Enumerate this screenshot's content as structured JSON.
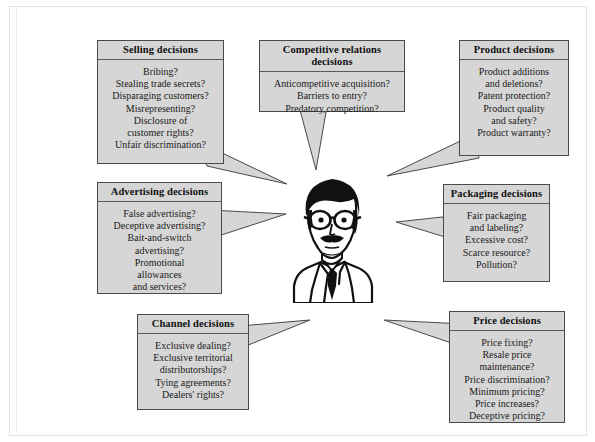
{
  "diagram": {
    "center_figure": "businessman-with-glasses-and-mustache"
  },
  "bubbles": [
    {
      "id": "selling",
      "title": "Selling decisions",
      "lines": [
        "Bribing?",
        "Stealing trade secrets?",
        "Disparaging customers?",
        "Misrepresenting?",
        "Disclosure of",
        "customer rights?",
        "Unfair discrimination?"
      ]
    },
    {
      "id": "competitive-relations",
      "title": "Competitive relations decisions",
      "lines": [
        "Anticompetitive acquisition?",
        "Barriers to entry?",
        "Predatory competition?"
      ]
    },
    {
      "id": "product",
      "title": "Product decisions",
      "lines": [
        "Product additions",
        "and deletions?",
        "Patent protection?",
        "Product quality",
        "and safety?",
        "Product warranty?"
      ]
    },
    {
      "id": "advertising",
      "title": "Advertising decisions",
      "lines": [
        "False advertising?",
        "Deceptive advertising?",
        "Bait-and-switch",
        "advertising?",
        "Promotional",
        "allowances",
        "and services?"
      ]
    },
    {
      "id": "packaging",
      "title": "Packaging decisions",
      "lines": [
        "Fair packaging",
        "and labeling?",
        "Excessive cost?",
        "Scarce resource?",
        "Pollution?"
      ]
    },
    {
      "id": "channel",
      "title": "Channel decisions",
      "lines": [
        "Exclusive dealing?",
        "Exclusive territorial",
        "distributorships?",
        "Tying agreements?",
        "Dealers' rights?"
      ]
    },
    {
      "id": "price",
      "title": "Price decisions",
      "lines": [
        "Price fixing?",
        "Resale price",
        "maintenance?",
        "Price discrimination?",
        "Minimum pricing?",
        "Price increases?",
        "Deceptive pricing?"
      ]
    }
  ],
  "colors": {
    "bubble_fill": "#d6d6d6",
    "bubble_border": "#4a4a4a",
    "page_background": "#ffffff",
    "text": "#141414"
  }
}
